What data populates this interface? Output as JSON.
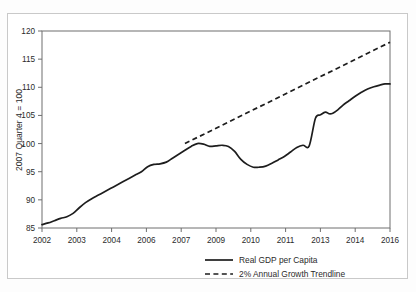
{
  "chart_data": {
    "type": "line",
    "title": "",
    "xlabel": "",
    "ylabel": "2007 Quarter 4 = 100",
    "xlim": [
      2002.0,
      2016.0
    ],
    "ylim": [
      85,
      120
    ],
    "grid": false,
    "legend_position": "bottom",
    "x_tick_labels": [
      "2002",
      "2003",
      "2004",
      "2006",
      "2007",
      "2009",
      "2010",
      "2011",
      "2013",
      "2014",
      "2016"
    ],
    "x_tick_values": [
      2002,
      2003.4,
      2004.8,
      2006.2,
      2007.6,
      2009.0,
      2010.4,
      2011.8,
      2013.2,
      2014.6,
      2016
    ],
    "y_tick_labels": [
      "85",
      "90",
      "95",
      "100",
      "105",
      "110",
      "115",
      "120"
    ],
    "y_tick_values": [
      85,
      90,
      95,
      100,
      105,
      110,
      115,
      120
    ],
    "series": [
      {
        "name": "Real GDP per Capita",
        "style": "solid",
        "color": "#1d1d1d",
        "x": [
          2002.0,
          2002.25,
          2002.5,
          2002.75,
          2003.0,
          2003.25,
          2003.5,
          2003.75,
          2004.0,
          2004.25,
          2004.5,
          2004.75,
          2005.0,
          2005.25,
          2005.5,
          2005.75,
          2006.0,
          2006.25,
          2006.5,
          2006.75,
          2007.0,
          2007.25,
          2007.5,
          2007.75,
          2008.0,
          2008.25,
          2008.5,
          2008.75,
          2009.0,
          2009.25,
          2009.5,
          2009.75,
          2010.0,
          2010.25,
          2010.5,
          2010.75,
          2011.0,
          2011.25,
          2011.5,
          2011.75,
          2012.0,
          2012.25,
          2012.5,
          2012.75,
          2013.0,
          2013.25,
          2013.5,
          2013.75,
          2014.0,
          2014.25,
          2014.5,
          2014.75,
          2015.0,
          2015.25,
          2015.5,
          2015.75,
          2016.0
        ],
        "y": [
          85.6,
          85.9,
          86.3,
          86.7,
          87.0,
          87.6,
          88.6,
          89.5,
          90.2,
          90.8,
          91.4,
          92.0,
          92.6,
          93.2,
          93.8,
          94.4,
          95.0,
          95.9,
          96.3,
          96.4,
          96.7,
          97.4,
          98.1,
          98.8,
          99.5,
          100.0,
          99.9,
          99.5,
          99.6,
          99.7,
          99.5,
          98.6,
          97.2,
          96.3,
          95.8,
          95.8,
          96.0,
          96.5,
          97.1,
          97.7,
          98.5,
          99.3,
          99.7,
          99.6,
          99.4,
          99.7,
          100.2,
          100.8,
          101.4,
          101.9,
          102.2,
          102.5,
          103.0,
          103.6,
          104.2,
          104.6,
          105.0
        ],
        "note": "quarterly index values, 2007Q4 = 100"
      },
      {
        "name": "2% Annual Growth Trendline",
        "style": "dashed",
        "color": "#1d1d1d",
        "x": [
          2007.75,
          2016.0
        ],
        "y": [
          100.0,
          118.0
        ]
      }
    ],
    "extended_series_note": "solid line continues beyond 2013 to ~110.6 at 2016; see series_tail",
    "series_tail": {
      "name": "Real GDP per Capita (2013-2016 detail)",
      "x": [
        2013.0,
        2013.2,
        2013.4,
        2013.55,
        2013.7,
        2013.9,
        2014.1,
        2014.35,
        2014.6,
        2014.85,
        2015.1,
        2015.35,
        2015.6,
        2015.8,
        2016.0
      ],
      "y": [
        104.5,
        105.1,
        105.6,
        105.3,
        105.4,
        106.0,
        106.8,
        107.6,
        108.4,
        109.1,
        109.7,
        110.1,
        110.4,
        110.6,
        110.6
      ]
    },
    "annotations": []
  },
  "legend": {
    "entries": [
      {
        "label": "Real GDP per Capita",
        "style": "solid"
      },
      {
        "label": "2% Annual Growth Trendline",
        "style": "dashed"
      }
    ]
  }
}
